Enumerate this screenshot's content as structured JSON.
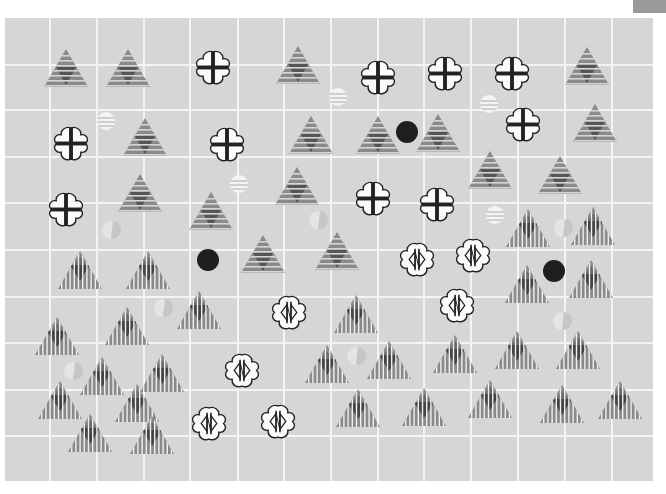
{
  "corner_tab": {
    "color": "#999999"
  },
  "board": {
    "background": "#d6d6d6",
    "grid_color": "#f4f4f4",
    "columns_x": [
      50,
      97,
      144,
      190,
      238,
      284,
      331,
      378,
      424,
      471,
      518,
      565,
      612
    ],
    "rows_y": [
      65,
      110,
      157,
      203,
      250,
      297,
      343,
      390,
      436
    ]
  },
  "pieces": {
    "triangle_horizontal": [
      [
        66,
        68
      ],
      [
        128,
        68
      ],
      [
        298,
        65
      ],
      [
        587,
        66
      ],
      [
        145,
        137
      ],
      [
        311,
        135
      ],
      [
        378,
        135
      ],
      [
        438,
        133
      ],
      [
        595,
        123
      ],
      [
        140,
        193
      ],
      [
        297,
        186
      ],
      [
        211,
        211
      ],
      [
        490,
        170
      ],
      [
        560,
        175
      ],
      [
        263,
        254
      ],
      [
        337,
        251
      ]
    ],
    "triangle_vertical": [
      [
        80,
        270
      ],
      [
        148,
        270
      ],
      [
        528,
        228
      ],
      [
        593,
        226
      ],
      [
        199,
        310
      ],
      [
        356,
        314
      ],
      [
        527,
        284
      ],
      [
        591,
        279
      ],
      [
        57,
        336
      ],
      [
        127,
        326
      ],
      [
        102,
        376
      ],
      [
        162,
        373
      ],
      [
        327,
        364
      ],
      [
        389,
        360
      ],
      [
        455,
        354
      ],
      [
        517,
        350
      ],
      [
        578,
        350
      ],
      [
        60,
        400
      ],
      [
        137,
        403
      ],
      [
        90,
        433
      ],
      [
        152,
        435
      ],
      [
        358,
        408
      ],
      [
        424,
        407
      ],
      [
        490,
        399
      ],
      [
        562,
        404
      ],
      [
        620,
        400
      ]
    ],
    "cloud_plus": [
      [
        213,
        67
      ],
      [
        378,
        77
      ],
      [
        445,
        73
      ],
      [
        512,
        73
      ],
      [
        71,
        143
      ],
      [
        227,
        144
      ],
      [
        523,
        124
      ],
      [
        66,
        209
      ],
      [
        373,
        198
      ],
      [
        437,
        204
      ]
    ],
    "cloud_diamond": [
      [
        417,
        259
      ],
      [
        473,
        255
      ],
      [
        457,
        305
      ],
      [
        289,
        312
      ],
      [
        242,
        370
      ],
      [
        209,
        423
      ],
      [
        278,
        421
      ]
    ],
    "black_dot": [
      [
        407,
        132
      ],
      [
        208,
        260
      ],
      [
        554,
        271
      ]
    ],
    "striped_circle": [
      [
        106,
        121
      ],
      [
        338,
        97
      ],
      [
        239,
        184
      ],
      [
        489,
        104
      ],
      [
        495,
        215
      ]
    ],
    "faint_circle": [
      [
        111,
        230
      ],
      [
        318,
        220
      ],
      [
        163,
        308
      ],
      [
        563,
        228
      ],
      [
        356,
        356
      ],
      [
        73,
        371
      ],
      [
        562,
        321
      ]
    ]
  }
}
